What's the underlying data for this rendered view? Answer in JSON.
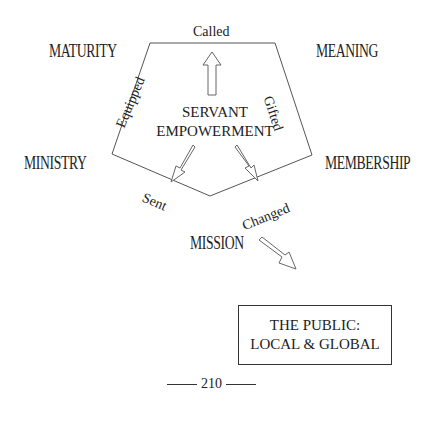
{
  "diagram": {
    "center_label": [
      "SERVANT",
      "EMPOWERMENT"
    ],
    "corners": {
      "top_left": "MATURITY",
      "top_right": "MEANING",
      "right": "MEMBERSHIP",
      "bottom": "MISSION",
      "left": "MINISTRY"
    },
    "edges": {
      "top": "Called",
      "right_upper": "Gifted",
      "right_lower": "Changed",
      "left_lower": "Sent",
      "left_upper": "Equipped"
    },
    "outcome_box": [
      "THE PUBLIC:",
      "LOCAL & GLOBAL"
    ]
  },
  "page": {
    "number": "210"
  }
}
